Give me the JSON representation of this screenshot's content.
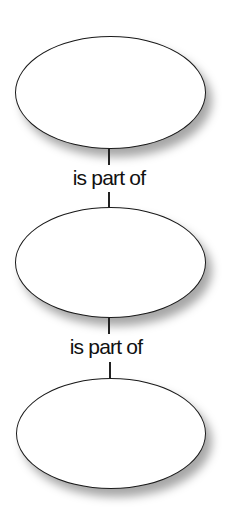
{
  "diagram": {
    "nodes": [
      {
        "id": "node-top",
        "label": ""
      },
      {
        "id": "node-middle",
        "label": ""
      },
      {
        "id": "node-bottom",
        "label": ""
      }
    ],
    "edges": [
      {
        "from": "node-top",
        "to": "node-middle",
        "label": "is part of"
      },
      {
        "from": "node-middle",
        "to": "node-bottom",
        "label": "is part of"
      }
    ]
  }
}
